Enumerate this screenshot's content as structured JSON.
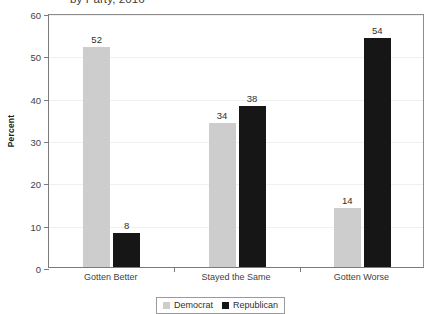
{
  "chart_data": {
    "type": "bar",
    "title": "by Party, 2016",
    "xlabel": "",
    "ylabel": "Percent",
    "ylim": [
      0,
      60
    ],
    "yticks": [
      0,
      10,
      20,
      30,
      40,
      50,
      60
    ],
    "grid": true,
    "legend_position": "bottom-center",
    "categories": [
      "Gotten Better",
      "Stayed the Same",
      "Gotten Worse"
    ],
    "series": [
      {
        "name": "Democrat",
        "color": "#cdcdcd",
        "values": [
          52,
          34,
          14
        ]
      },
      {
        "name": "Republican",
        "color": "#161616",
        "values": [
          8,
          38,
          54
        ]
      }
    ]
  },
  "axis": {
    "y_title": "Percent",
    "y_labels": [
      "60",
      "50",
      "40",
      "30",
      "20",
      "10",
      "0"
    ],
    "x_labels": [
      "Gotten Better",
      "Stayed the Same",
      "Gotten Worse"
    ]
  },
  "values": {
    "dem": [
      "52",
      "34",
      "14"
    ],
    "rep": [
      "8",
      "38",
      "54"
    ]
  },
  "legend": {
    "items": [
      {
        "label": "Democrat"
      },
      {
        "label": "Republican"
      }
    ]
  }
}
